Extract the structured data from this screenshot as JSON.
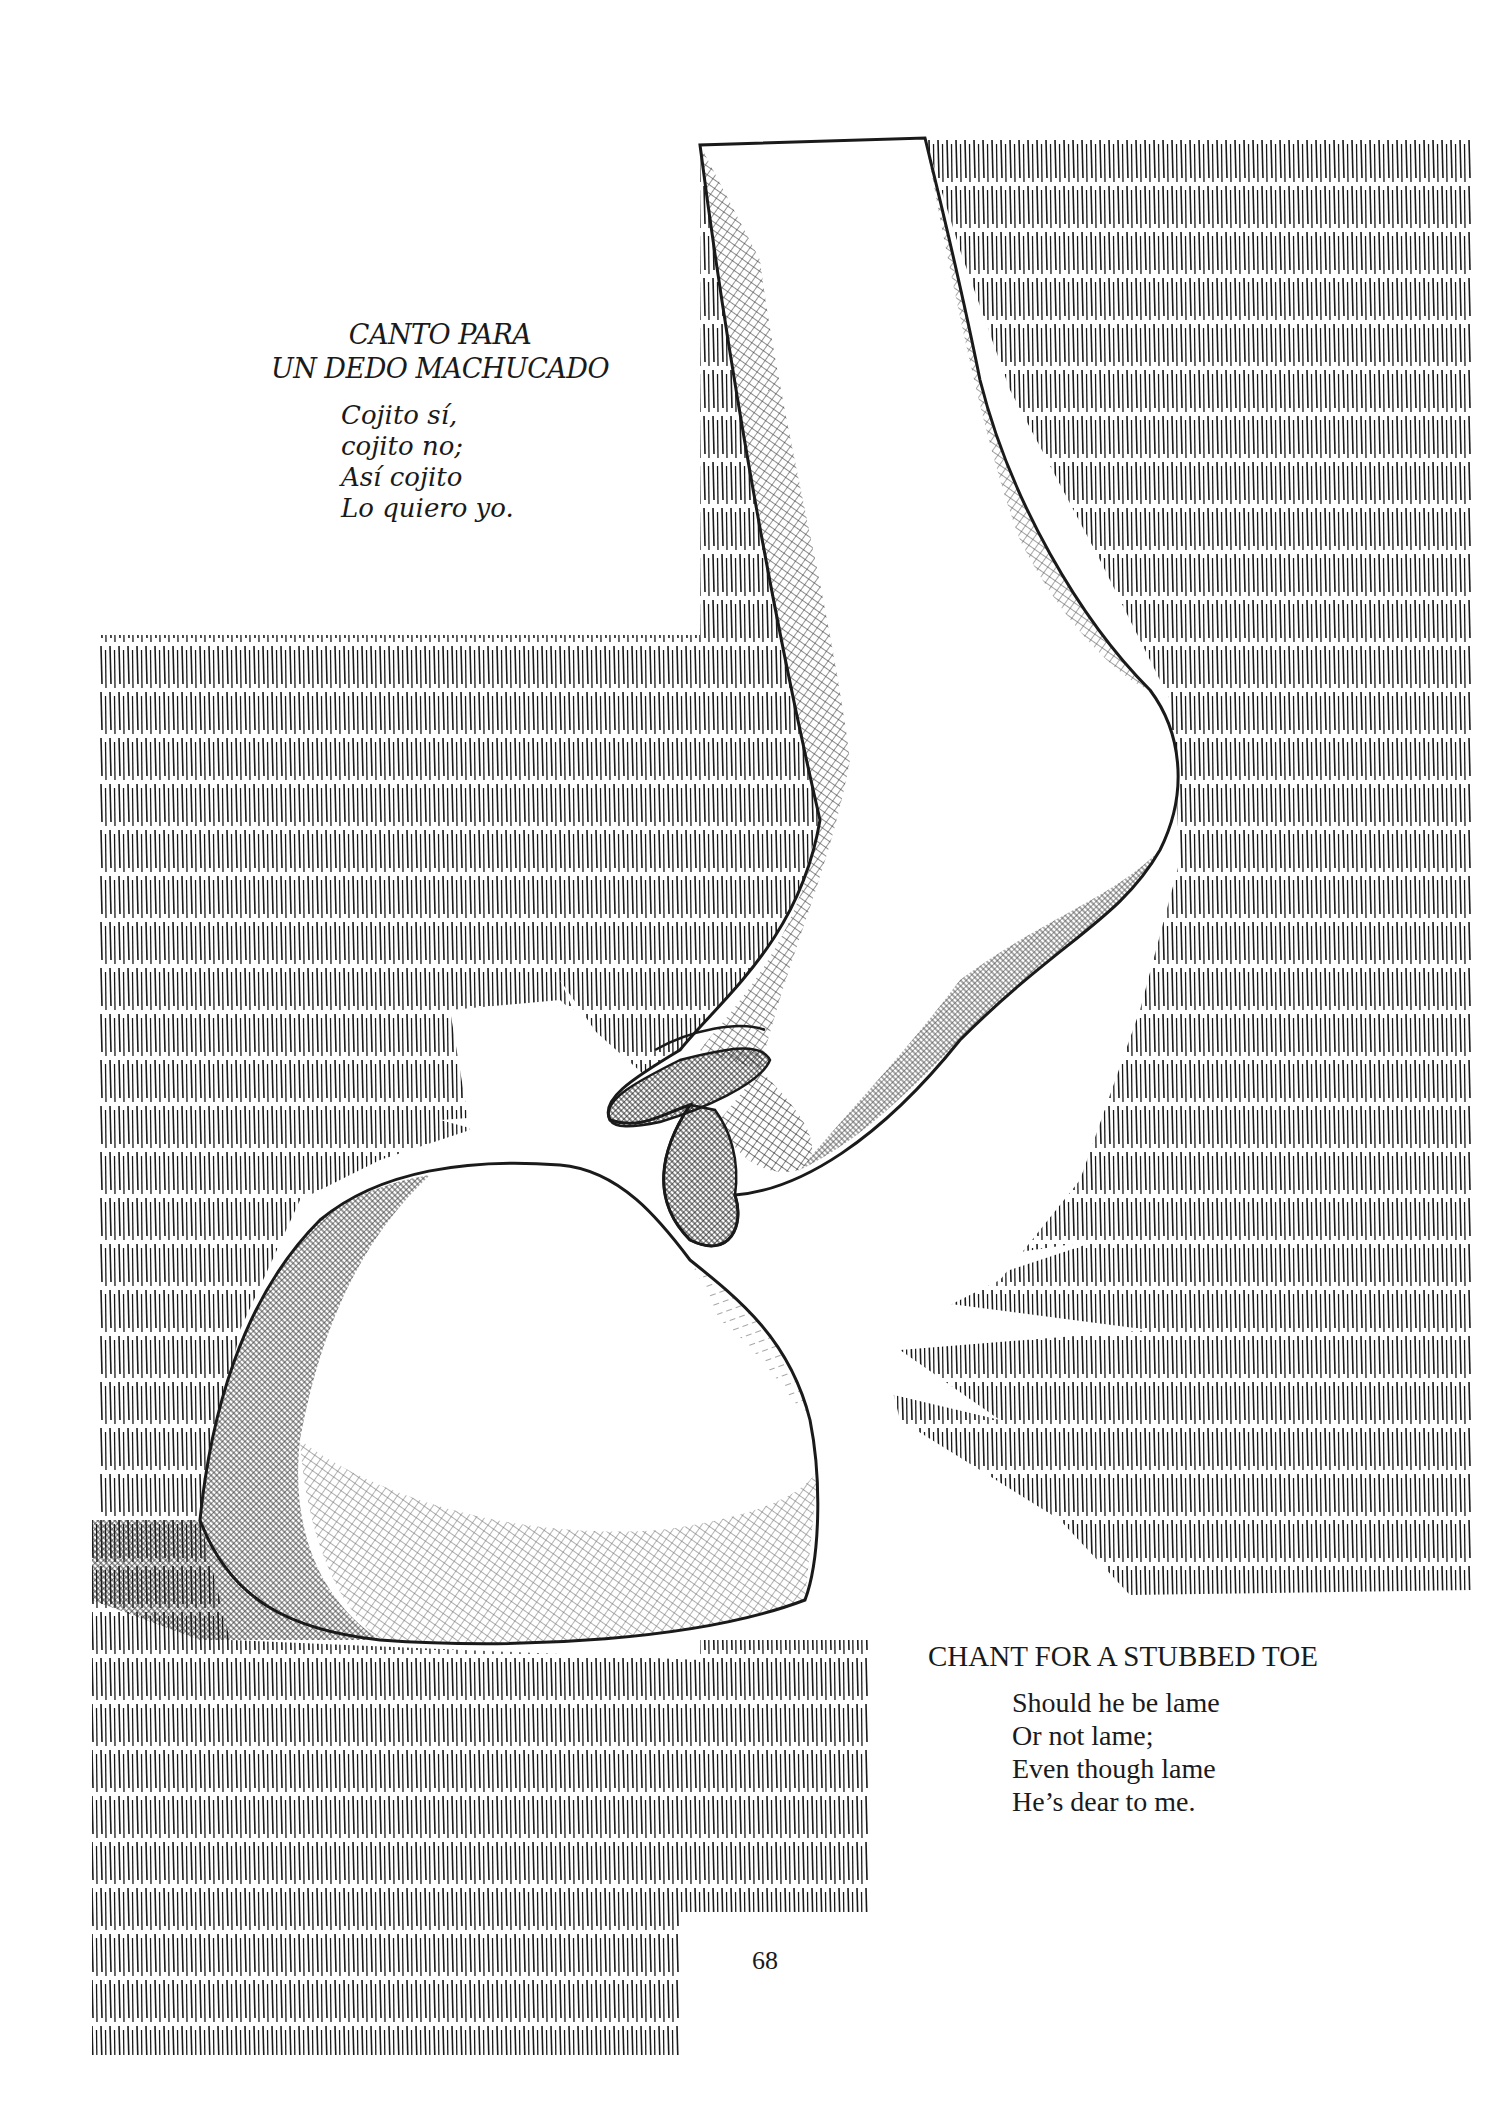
{
  "page": {
    "number": "68",
    "background": "#ffffff",
    "ink": "#1a1a1a"
  },
  "illustration": {
    "subject": "foot stubbing toe on rock",
    "elements": [
      "hatched-background-upper-right",
      "hatched-background-lower-left",
      "leg-and-foot",
      "rock",
      "impact-burst"
    ]
  },
  "poem_spanish": {
    "title_lines": [
      "CANTO PARA",
      "UN DEDO MACHUCADO"
    ],
    "verses": [
      "Cojito sí,",
      "cojito no;",
      "Así cojito",
      "Lo quiero yo."
    ]
  },
  "poem_english": {
    "title": "CHANT FOR A STUBBED TOE",
    "verses": [
      "Should he be lame",
      "Or not lame;",
      "Even though lame",
      "He’s dear to me."
    ]
  }
}
